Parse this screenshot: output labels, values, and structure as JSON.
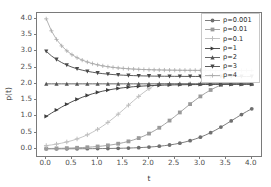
{
  "chart_data": {
    "type": "line",
    "title": "",
    "xlabel": "t",
    "ylabel": "p(t)",
    "xlim": [
      -0.18,
      4.18
    ],
    "ylim": [
      -0.22,
      4.18
    ],
    "xticks": [
      "0.0",
      "0.5",
      "1.0",
      "1.5",
      "2.0",
      "2.5",
      "3.0",
      "3.5",
      "4.0"
    ],
    "xtick_values": [
      0.0,
      0.5,
      1.0,
      1.5,
      2.0,
      2.5,
      3.0,
      3.5,
      4.0
    ],
    "yticks": [
      "0.0",
      "0.5",
      "1.0",
      "1.5",
      "2.0",
      "2.5",
      "3.0",
      "3.5",
      "4.0"
    ],
    "ytick_values": [
      0.0,
      0.5,
      1.0,
      1.5,
      2.0,
      2.5,
      3.0,
      3.5,
      4.0
    ],
    "grid": false,
    "legend_position": "upper right",
    "equilibrium": 2.0,
    "x": [
      0.0,
      0.1,
      0.2,
      0.3,
      0.4,
      0.5,
      0.6,
      0.7,
      0.8,
      0.9,
      1.0,
      1.1,
      1.2,
      1.3,
      1.4,
      1.5,
      1.6,
      1.7,
      1.8,
      1.9,
      2.0,
      2.1,
      2.2,
      2.3,
      2.4,
      2.5,
      2.6,
      2.7,
      2.8,
      2.9,
      3.0,
      3.1,
      3.2,
      3.3,
      3.4,
      3.5,
      3.6,
      3.7,
      3.8,
      3.9,
      4.0
    ],
    "series": [
      {
        "name": "p=0.001",
        "label": "p=0.001",
        "marker": "circle",
        "color": "#6f6f6f",
        "p0": 0.001,
        "values": [
          0.001,
          0.0012,
          0.0015,
          0.0018,
          0.0022,
          0.0027,
          0.0033,
          0.0041,
          0.005,
          0.0061,
          0.0074,
          0.009,
          0.011,
          0.0135,
          0.0165,
          0.0201,
          0.0246,
          0.03,
          0.0366,
          0.0447,
          0.0545,
          0.0664,
          0.0808,
          0.0982,
          0.1192,
          0.1444,
          0.1745,
          0.2103,
          0.2526,
          0.302,
          0.3592,
          0.4246,
          0.4983,
          0.5799,
          0.6685,
          0.7627,
          0.8602,
          0.9586,
          1.0551,
          1.1472,
          1.2329
        ]
      },
      {
        "name": "p=0.01",
        "label": "p=0.01",
        "marker": "square",
        "color": "#9a9a9a",
        "p0": 0.01,
        "values": [
          0.01,
          0.0122,
          0.0149,
          0.0182,
          0.0222,
          0.0271,
          0.0331,
          0.0403,
          0.0491,
          0.0598,
          0.0728,
          0.0885,
          0.1075,
          0.1304,
          0.1579,
          0.1908,
          0.23,
          0.2765,
          0.3313,
          0.3953,
          0.4693,
          0.5539,
          0.6493,
          0.755,
          0.8701,
          0.9926,
          1.1201,
          1.2493,
          1.3769,
          1.4995,
          1.614,
          1.7185,
          1.8115,
          1.8925,
          1.9617,
          2.0,
          2.0,
          2.0,
          2.0,
          2.0,
          2.0
        ]
      },
      {
        "name": "p=0.1",
        "label": "p=0.1",
        "marker": "plus",
        "color": "#bdbdbd",
        "p0": 0.1,
        "values": [
          0.1,
          0.1209,
          0.146,
          0.1761,
          0.212,
          0.2546,
          0.3049,
          0.3638,
          0.4323,
          0.5112,
          0.6011,
          0.7022,
          0.8143,
          0.9366,
          1.0674,
          1.2041,
          1.3436,
          1.4819,
          1.6149,
          1.7388,
          1.8502,
          1.9465,
          2.0,
          2.0,
          2.0,
          2.0,
          2.0,
          2.0,
          2.0,
          2.0,
          2.0,
          2.0,
          2.0,
          2.0,
          2.0,
          2.0,
          2.0,
          2.0,
          2.0,
          2.0,
          2.0
        ]
      },
      {
        "name": "p=1",
        "label": "p=1",
        "marker": "triangle-right",
        "color": "#3d3d3d",
        "p0": 1.0,
        "values": [
          1.0,
          1.0986,
          1.1947,
          1.2863,
          1.3721,
          1.4511,
          1.5229,
          1.5872,
          1.6442,
          1.6943,
          1.738,
          1.7759,
          1.8085,
          1.8364,
          1.8602,
          1.8804,
          1.8975,
          1.9119,
          1.924,
          1.9342,
          1.9427,
          1.9499,
          1.9559,
          1.9609,
          1.9651,
          1.9686,
          1.9716,
          1.9741,
          1.9762,
          1.9779,
          1.9794,
          1.9806,
          1.9817,
          1.9826,
          1.9833,
          1.984,
          1.9846,
          1.985,
          1.9854,
          1.9858,
          1.9861
        ]
      },
      {
        "name": "p=2",
        "label": "p=2",
        "marker": "triangle-up",
        "color": "#555555",
        "p0": 2.0,
        "values": [
          2.0,
          2.0,
          2.0,
          2.0,
          2.0,
          2.0,
          2.0,
          2.0,
          2.0,
          2.0,
          2.0,
          2.0,
          2.0,
          2.0,
          2.0,
          2.0,
          2.0,
          2.0,
          2.0,
          2.0,
          2.0,
          2.0,
          2.0,
          2.0,
          2.0,
          2.0,
          2.0,
          2.0,
          2.0,
          2.0,
          2.0,
          2.0,
          2.0,
          2.0,
          2.0,
          2.0,
          2.0,
          2.0,
          2.0,
          2.0,
          2.0
        ]
      },
      {
        "name": "p=3",
        "label": "p=3",
        "marker": "triangle-down",
        "color": "#4a4a4a",
        "p0": 3.0,
        "values": [
          3.0,
          2.8624,
          2.7488,
          2.6553,
          2.5784,
          2.5152,
          2.4634,
          2.4209,
          2.386,
          2.3574,
          2.3339,
          2.3146,
          2.2988,
          2.2858,
          2.2752,
          2.2664,
          2.2592,
          2.2533,
          2.2484,
          2.2444,
          2.241,
          2.2383,
          2.236,
          2.2341,
          2.2326,
          2.2313,
          2.2302,
          2.2293,
          2.2286,
          2.228,
          2.2275,
          2.2271,
          2.2267,
          2.2264,
          2.2262,
          2.226,
          2.2258,
          2.2257,
          2.2256,
          2.2255,
          2.2254
        ]
      },
      {
        "name": "p=4",
        "label": "p=4",
        "marker": "plus-thin",
        "color": "#aaaaaa",
        "p0": 4.0,
        "values": [
          4.0,
          3.6321,
          3.3665,
          3.1679,
          3.0159,
          2.8977,
          2.8046,
          2.7306,
          2.6713,
          2.6235,
          2.5848,
          2.5534,
          2.5278,
          2.5069,
          2.4898,
          2.4758,
          2.4643,
          2.4549,
          2.4471,
          2.4407,
          2.4355,
          2.4311,
          2.4275,
          2.4246,
          2.4221,
          2.4201,
          2.4184,
          2.417,
          2.4159,
          2.4149,
          2.4141,
          2.4135,
          2.4129,
          2.4125,
          2.4121,
          2.4118,
          2.4115,
          2.4113,
          2.4111,
          2.411,
          2.4109
        ]
      }
    ]
  },
  "figure": {
    "background": "#ffffff",
    "axes_color": "#7a7a7a",
    "tick_color": "#4d4d4d"
  }
}
